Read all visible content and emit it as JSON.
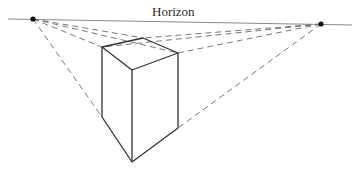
{
  "diagram": {
    "type": "two-point-perspective",
    "horizon_label": "Horizon",
    "colors": {
      "background": "#ffffff",
      "horizon": "#8a8a8a",
      "construction_lines": "#6a6a6a",
      "cube_edges": "#333333",
      "vanishing_points": "#111111"
    },
    "horizon_line": {
      "x1": 8,
      "y1": 19,
      "x2": 352,
      "y2": 25
    },
    "vanishing_points": [
      {
        "name": "left",
        "x": 33,
        "y": 19
      },
      {
        "name": "right",
        "x": 321,
        "y": 24
      }
    ],
    "cube_vertices": {
      "top_back": {
        "x": 143,
        "y": 38
      },
      "top_left": {
        "x": 102,
        "y": 47
      },
      "top_right": {
        "x": 178,
        "y": 53
      },
      "top_front": {
        "x": 132,
        "y": 70
      },
      "bottom_left": {
        "x": 102,
        "y": 117
      },
      "bottom_front": {
        "x": 132,
        "y": 162
      },
      "bottom_right": {
        "x": 178,
        "y": 128
      }
    }
  }
}
